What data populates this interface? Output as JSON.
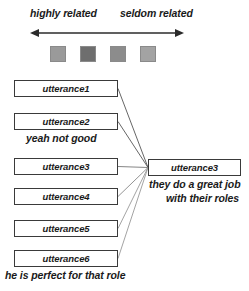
{
  "legend": {
    "left_label": "highly related",
    "right_label": "seldom related",
    "axis_icon": "double-headed-arrow-icon",
    "swatches": [
      {
        "name": "swatch-highly-related",
        "color": "#9a9a9a"
      },
      {
        "name": "swatch-related",
        "color": "#6e6e6e"
      },
      {
        "name": "swatch-somewhat-related",
        "color": "#8c8c8c"
      },
      {
        "name": "swatch-seldom-related",
        "color": "#a3a3a3"
      }
    ]
  },
  "left_column": {
    "items": [
      {
        "id": "u1",
        "label": "utterance1",
        "caption": ""
      },
      {
        "id": "u2",
        "label": "utterance2",
        "caption": "yeah not good"
      },
      {
        "id": "u3",
        "label": "utterance3",
        "caption": ""
      },
      {
        "id": "u4",
        "label": "utterance4",
        "caption": ""
      },
      {
        "id": "u5",
        "label": "utterance5",
        "caption": ""
      },
      {
        "id": "u6",
        "label": "utterance6",
        "caption": "he is perfect for that role"
      }
    ]
  },
  "right_node": {
    "label": "utterance3",
    "caption_line1": "they do a great job",
    "caption_line2": "with their roles"
  },
  "links": [
    {
      "from": "u1",
      "to": "right_node",
      "shade": "#555555"
    },
    {
      "from": "u2",
      "to": "right_node",
      "shade": "#555555"
    },
    {
      "from": "u3",
      "to": "right_node",
      "shade": "#777777"
    },
    {
      "from": "u4",
      "to": "right_node",
      "shade": "#888888"
    },
    {
      "from": "u5",
      "to": "right_node",
      "shade": "#999999"
    },
    {
      "from": "u6",
      "to": "right_node",
      "shade": "#999999"
    }
  ],
  "colors": {
    "box_border": "#3a3a3a",
    "text": "#1a1a1a",
    "background": "#ffffff"
  }
}
